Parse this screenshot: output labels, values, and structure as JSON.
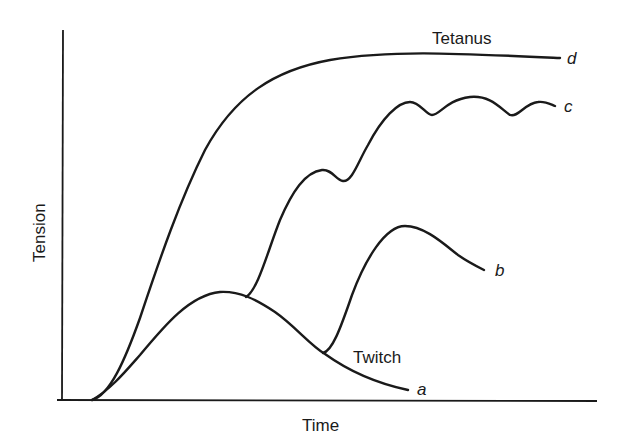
{
  "diagram": {
    "axes": {
      "x_label": "Time",
      "y_label": "Tension"
    },
    "curves": [
      {
        "id": "a",
        "label": "a",
        "name": "Twitch",
        "description": "single twitch"
      },
      {
        "id": "b",
        "label": "b",
        "name": "",
        "description": "summation of two twitches"
      },
      {
        "id": "c",
        "label": "c",
        "name": "",
        "description": "incomplete (unfused) tetanus"
      },
      {
        "id": "d",
        "label": "d",
        "name": "Tetanus",
        "description": "complete (fused) tetanus"
      }
    ],
    "annotations": {
      "tetanus": "Tetanus",
      "twitch": "Twitch"
    },
    "colors": {
      "line": "#1a1a1a",
      "background": "#ffffff"
    }
  }
}
